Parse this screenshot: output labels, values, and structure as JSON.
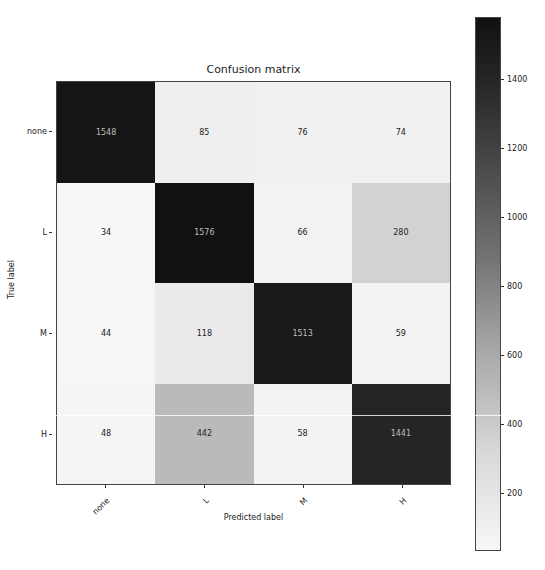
{
  "chart_data": {
    "type": "heatmap",
    "title": "Confusion matrix",
    "xlabel": "Predicted label",
    "ylabel": "True label",
    "x_categories": [
      "none",
      "L",
      "M",
      "H"
    ],
    "y_categories": [
      "none",
      "L",
      "M",
      "H"
    ],
    "values": [
      [
        1548,
        85,
        76,
        74
      ],
      [
        34,
        1576,
        66,
        280
      ],
      [
        44,
        118,
        1513,
        59
      ],
      [
        48,
        442,
        58,
        1441
      ]
    ],
    "colormap": "Greys",
    "colorbar": {
      "range": [
        34,
        1576
      ],
      "ticks": [
        200,
        400,
        600,
        800,
        1000,
        1200,
        1400
      ]
    },
    "grid": false,
    "legend_position": "right (colorbar)"
  },
  "labels": {
    "title": "Confusion matrix",
    "xlabel": "Predicted label",
    "ylabel": "True label",
    "x_ticks": [
      "none",
      "L",
      "M",
      "H"
    ],
    "y_ticks": [
      "none",
      "L",
      "M",
      "H"
    ],
    "cbar_ticks": [
      "1400",
      "1200",
      "1000",
      "800",
      "600",
      "400",
      "200"
    ]
  }
}
